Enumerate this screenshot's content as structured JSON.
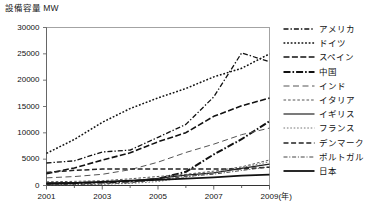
{
  "chart_data": {
    "type": "line",
    "title": "設備容量 MW",
    "ylabel": "設備容量 MW",
    "xlabel": "(年)",
    "unit_label": "MW",
    "x": [
      2001,
      2002,
      2003,
      2004,
      2005,
      2006,
      2007,
      2008,
      2009
    ],
    "xtick_labels": [
      "2001",
      "2003",
      "2005",
      "2007",
      "2009"
    ],
    "xtick_values": [
      2001,
      2003,
      2005,
      2007,
      2009
    ],
    "xlim": [
      2001,
      2009
    ],
    "ytick_labels": [
      "0",
      "5000",
      "10000",
      "15000",
      "20000",
      "25000",
      "30000"
    ],
    "ytick_values": [
      0,
      5000,
      10000,
      15000,
      20000,
      25000,
      30000
    ],
    "ylim": [
      0,
      30000
    ],
    "grid": false,
    "legend_position": "right",
    "series": [
      {
        "name": "アメリカ",
        "style": "dashdot",
        "values": [
          4275,
          4685,
          6370,
          6725,
          9150,
          11600,
          16820,
          25170,
          23500
        ]
      },
      {
        "name": "ドイツ",
        "style": "dotted",
        "values": [
          6100,
          8750,
          11990,
          14610,
          16630,
          18420,
          20620,
          22250,
          25000
        ]
      },
      {
        "name": "スペイン",
        "style": "dashed",
        "values": [
          2235,
          3340,
          4825,
          6200,
          8300,
          10030,
          13130,
          15130,
          16600
        ]
      },
      {
        "name": "中国",
        "style": "dashdot-bold",
        "values": [
          400,
          470,
          570,
          760,
          1270,
          2600,
          5900,
          8800,
          12200
        ]
      },
      {
        "name": "インド",
        "style": "longdash",
        "values": [
          1450,
          1700,
          2125,
          3000,
          4430,
          6270,
          7850,
          9655,
          10900
        ]
      },
      {
        "name": "イタリア",
        "style": "finedash",
        "values": [
          700,
          785,
          905,
          1265,
          1715,
          2120,
          2720,
          3540,
          4850
        ]
      },
      {
        "name": "イギリス",
        "style": "solid-thin",
        "values": [
          480,
          570,
          650,
          890,
          1350,
          1960,
          2400,
          3240,
          4050
        ]
      },
      {
        "name": "フランス",
        "style": "dotted-light",
        "values": [
          85,
          145,
          240,
          390,
          750,
          1570,
          2450,
          3400,
          4500
        ]
      },
      {
        "name": "デンマーク",
        "style": "dashed-mid",
        "values": [
          2490,
          2880,
          3115,
          3120,
          3130,
          3140,
          3125,
          3160,
          3480
        ]
      },
      {
        "name": "ポルトガル",
        "style": "dashdot-thin",
        "values": [
          125,
          195,
          300,
          525,
          1060,
          1720,
          2150,
          2860,
          3530
        ]
      },
      {
        "name": "日本",
        "style": "solid-bold",
        "values": [
          320,
          460,
          680,
          940,
          1080,
          1310,
          1540,
          1880,
          2080
        ]
      }
    ]
  }
}
